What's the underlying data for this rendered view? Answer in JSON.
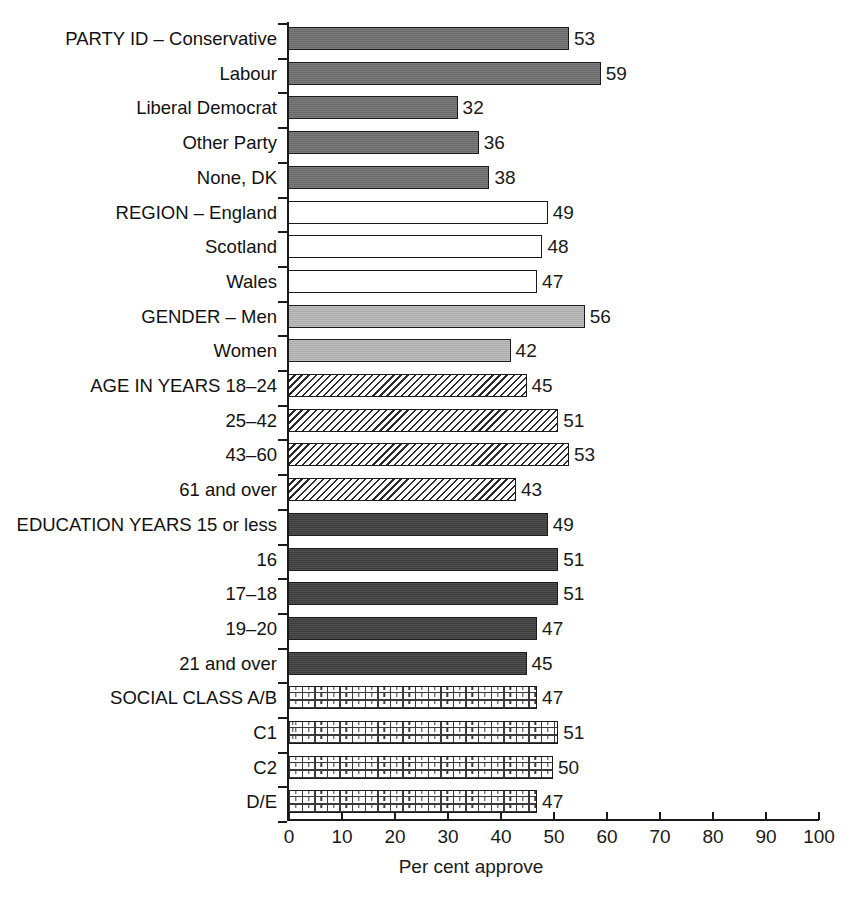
{
  "chart_data": {
    "type": "bar",
    "orientation": "horizontal",
    "title": "",
    "xlabel": "Per cent approve",
    "ylabel": "",
    "xlim": [
      0,
      100
    ],
    "xticks": [
      0,
      10,
      20,
      30,
      40,
      50,
      60,
      70,
      80,
      90,
      100
    ],
    "grid": false,
    "legend": false,
    "categories": [
      "PARTY ID – Conservative",
      "Labour",
      "Liberal Democrat",
      "Other Party",
      "None, DK",
      "REGION – England",
      "Scotland",
      "Wales",
      "GENDER – Men",
      "Women",
      "AGE IN YEARS 18–24",
      "25–42",
      "43–60",
      "61 and over",
      "EDUCATION YEARS 15 or less",
      "16",
      "17–18",
      "19–20",
      "21 and over",
      "SOCIAL CLASS A/B",
      "C1",
      "C2",
      "D/E"
    ],
    "values": [
      53,
      59,
      32,
      36,
      38,
      49,
      48,
      47,
      56,
      42,
      45,
      51,
      53,
      43,
      49,
      51,
      51,
      47,
      45,
      47,
      51,
      50,
      47
    ],
    "groups": [
      {
        "name": "PARTY ID",
        "pattern": "solid-medium-gray",
        "color": "#6e6e6e",
        "indices": [
          0,
          1,
          2,
          3,
          4
        ]
      },
      {
        "name": "REGION",
        "pattern": "open-white",
        "color": "#ffffff",
        "indices": [
          5,
          6,
          7
        ]
      },
      {
        "name": "GENDER",
        "pattern": "solid-light-gray",
        "color": "#b3b3b3",
        "indices": [
          8,
          9
        ]
      },
      {
        "name": "AGE IN YEARS",
        "pattern": "diagonal-hatch",
        "color": "#ffffff",
        "indices": [
          10,
          11,
          12,
          13
        ]
      },
      {
        "name": "EDUCATION YEARS",
        "pattern": "solid-dark-gray",
        "color": "#434343",
        "indices": [
          14,
          15,
          16,
          17,
          18
        ]
      },
      {
        "name": "SOCIAL CLASS",
        "pattern": "brick",
        "color": "#fbfbfb",
        "indices": [
          19,
          20,
          21,
          22
        ]
      }
    ]
  },
  "axis": {
    "x_title": "Per cent approve",
    "tick_labels": [
      "0",
      "10",
      "20",
      "30",
      "40",
      "50",
      "60",
      "70",
      "80",
      "90",
      "100"
    ]
  },
  "bars": [
    {
      "label": "PARTY ID – Conservative",
      "value": 53,
      "value_text": "53",
      "fill": "fill-party"
    },
    {
      "label": "Labour",
      "value": 59,
      "value_text": "59",
      "fill": "fill-party"
    },
    {
      "label": "Liberal Democrat",
      "value": 32,
      "value_text": "32",
      "fill": "fill-party"
    },
    {
      "label": "Other Party",
      "value": 36,
      "value_text": "36",
      "fill": "fill-party"
    },
    {
      "label": "None, DK",
      "value": 38,
      "value_text": "38",
      "fill": "fill-party"
    },
    {
      "label": "REGION – England",
      "value": 49,
      "value_text": "49",
      "fill": "fill-region"
    },
    {
      "label": "Scotland",
      "value": 48,
      "value_text": "48",
      "fill": "fill-region"
    },
    {
      "label": "Wales",
      "value": 47,
      "value_text": "47",
      "fill": "fill-region"
    },
    {
      "label": "GENDER – Men",
      "value": 56,
      "value_text": "56",
      "fill": "fill-gender"
    },
    {
      "label": "Women",
      "value": 42,
      "value_text": "42",
      "fill": "fill-gender"
    },
    {
      "label": "AGE IN YEARS 18–24",
      "value": 45,
      "value_text": "45",
      "fill": "fill-age"
    },
    {
      "label": "25–42",
      "value": 51,
      "value_text": "51",
      "fill": "fill-age"
    },
    {
      "label": "43–60",
      "value": 53,
      "value_text": "53",
      "fill": "fill-age"
    },
    {
      "label": "61 and over",
      "value": 43,
      "value_text": "43",
      "fill": "fill-age"
    },
    {
      "label": "EDUCATION YEARS 15 or less",
      "value": 49,
      "value_text": "49",
      "fill": "fill-education"
    },
    {
      "label": "16",
      "value": 51,
      "value_text": "51",
      "fill": "fill-education"
    },
    {
      "label": "17–18",
      "value": 51,
      "value_text": "51",
      "fill": "fill-education"
    },
    {
      "label": "19–20",
      "value": 47,
      "value_text": "47",
      "fill": "fill-education"
    },
    {
      "label": "21 and over",
      "value": 45,
      "value_text": "45",
      "fill": "fill-education"
    },
    {
      "label": "SOCIAL CLASS A/B",
      "value": 47,
      "value_text": "47",
      "fill": "fill-social"
    },
    {
      "label": "C1",
      "value": 51,
      "value_text": "51",
      "fill": "fill-social"
    },
    {
      "label": "C2",
      "value": 50,
      "value_text": "50",
      "fill": "fill-social"
    },
    {
      "label": "D/E",
      "value": 47,
      "value_text": "47",
      "fill": "fill-social"
    }
  ]
}
